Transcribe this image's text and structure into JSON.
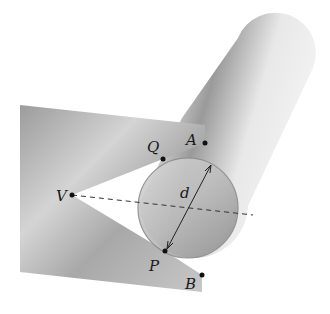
{
  "diagram": {
    "type": "v-block with cylinder",
    "labels": {
      "A": "A",
      "B": "B",
      "Q": "Q",
      "P": "P",
      "V": "V",
      "d": "d"
    },
    "points": {
      "A": [
        205,
        143
      ],
      "B": [
        202,
        275
      ],
      "Q": [
        163,
        159
      ],
      "P": [
        165,
        251
      ],
      "V": [
        72,
        195
      ]
    },
    "circle": {
      "cx": 188,
      "cy": 208,
      "r": 50
    },
    "colors": {
      "block": "#b8b8b8",
      "cylinder": "#c4c4c4",
      "line": "#222222",
      "dashed": "#333333"
    }
  }
}
